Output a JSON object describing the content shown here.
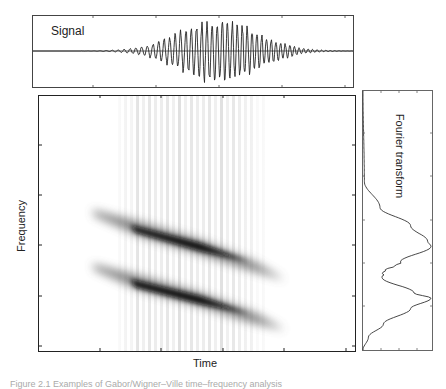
{
  "figure": {
    "caption_partial": "Figure 2.1  Examples of Gabor/Wigner–Ville time–frequency analysis"
  },
  "chart_data": [
    {
      "type": "line",
      "title": "Signal",
      "xlabel": "",
      "ylabel": "",
      "description": "Chirped oscillating signal with Gaussian envelope, amplitude largest near center",
      "envelope_center_x": 0.58,
      "x_ticks_px": [
        93,
        156,
        219,
        282,
        345
      ],
      "grid": false
    },
    {
      "type": "heatmap",
      "title": "",
      "xlabel": "Time",
      "ylabel": "Frequency",
      "description": "Spectrogram showing two parallel descending chirp components with vertical interference stripes",
      "bands": [
        {
          "name": "upper component",
          "start": [
            0.18,
            0.45
          ],
          "end": [
            0.77,
            0.73
          ],
          "peak": [
            0.51,
            0.58
          ]
        },
        {
          "name": "lower component",
          "start": [
            0.18,
            0.66
          ],
          "end": [
            0.77,
            0.92
          ],
          "peak": [
            0.51,
            0.79
          ]
        }
      ],
      "stripe_region_x": [
        0.26,
        0.68
      ],
      "x_ticks_px": [
        100,
        161,
        223,
        284,
        346
      ],
      "y_ticks_px": [
        145,
        195,
        245,
        296,
        346
      ],
      "grid": false
    },
    {
      "type": "line",
      "title": "Fourier transform",
      "orientation": "vertical",
      "description": "Spectrum magnitude with two peaks aligned with the two chirp frequency bands",
      "y_norm": [
        0.0,
        0.35,
        0.45,
        0.52,
        0.58,
        0.6,
        0.66,
        0.7,
        0.72,
        0.78,
        0.8,
        0.84,
        0.9,
        0.95,
        1.0
      ],
      "values": [
        0.0,
        0.02,
        0.25,
        0.7,
        0.95,
        1.0,
        0.55,
        0.3,
        0.28,
        0.75,
        1.0,
        0.7,
        0.3,
        0.08,
        0.0
      ]
    }
  ],
  "labels": {
    "signal": "Signal",
    "time": "Time",
    "frequency": "Frequency",
    "fourier": "Fourier transform"
  }
}
